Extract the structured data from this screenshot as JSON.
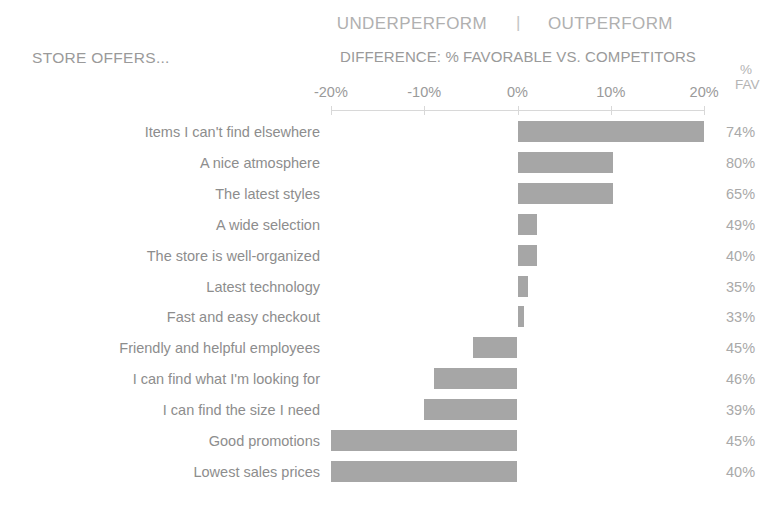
{
  "header": {
    "underperform_label": "UNDERPERFORM",
    "separator": "|",
    "outperform_label": "OUTPERFORM",
    "category_header": "STORE OFFERS...",
    "axis_title": "DIFFERENCE: % FAVORABLE VS. COMPETITORS",
    "fav_col_pct": "%",
    "fav_col_word": "FAV"
  },
  "chart_data": {
    "type": "bar",
    "orientation": "horizontal",
    "title": "DIFFERENCE: % FAVORABLE VS. COMPETITORS",
    "subtitle": "UNDERPERFORM | OUTPERFORM",
    "xlabel": "DIFFERENCE: % FAVORABLE VS. COMPETITORS",
    "ylabel": "STORE OFFERS...",
    "xlim": [
      -20,
      20
    ],
    "grid": false,
    "legend": null,
    "bar_color": "#a6a6a6",
    "tick_labels": [
      "-20%",
      "-10%",
      "0%",
      "10%",
      "20%"
    ],
    "tick_values": [
      -20,
      -10,
      0,
      10,
      20
    ],
    "categories": [
      "Items I can't find elsewhere",
      "A nice atmosphere",
      "The latest styles",
      "A wide selection",
      "The store is well-organized",
      "Latest technology",
      "Fast and easy checkout",
      "Friendly and helpful employees",
      "I can find what I'm looking for",
      "I can find the size I need",
      "Good promotions",
      "Lowest sales prices"
    ],
    "values": [
      20.0,
      10.2,
      10.2,
      2.1,
      2.1,
      1.1,
      0.7,
      -4.8,
      -8.9,
      -10.0,
      -20.0,
      -20.0
    ],
    "secondary_column": {
      "name": "% FAV",
      "values": [
        "74%",
        "80%",
        "65%",
        "49%",
        "40%",
        "35%",
        "33%",
        "45%",
        "46%",
        "39%",
        "45%",
        "40%"
      ]
    }
  }
}
